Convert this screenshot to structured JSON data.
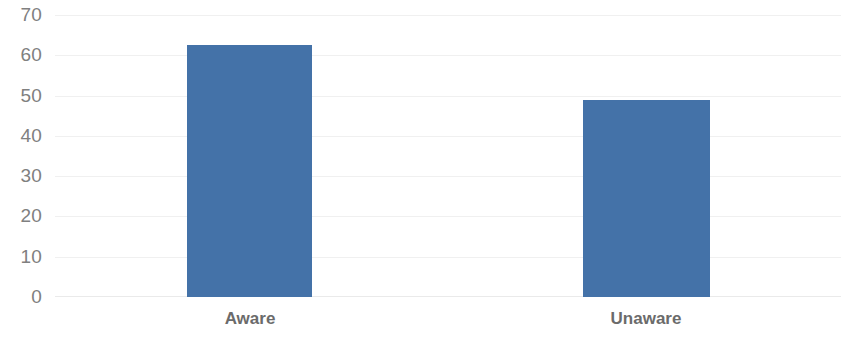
{
  "chart_data": {
    "type": "bar",
    "title": "",
    "subtitle": "",
    "xlabel": "",
    "ylabel": "",
    "categories": [
      "Aware",
      "Unaware"
    ],
    "values": [
      62.5,
      49
    ],
    "series": [
      {
        "name": "",
        "values": [
          62.5,
          49
        ]
      }
    ],
    "ylim": [
      0,
      70
    ],
    "y_ticks": [
      0,
      10,
      20,
      30,
      40,
      50,
      60,
      70
    ],
    "y_tick_labels": [
      "0",
      "10",
      "20",
      "30",
      "40",
      "50",
      "60",
      "70"
    ],
    "grid": true,
    "grid_axis": "y",
    "legend": false,
    "legend_position": "none",
    "annotations": [],
    "colors": {
      "bar": "#4472a8",
      "gridline": "#f0f0f0",
      "baseline": "#eaeaea",
      "y_tick_label": "#808080",
      "x_tick_label": "#6b6b6b",
      "background": "#ffffff"
    }
  }
}
